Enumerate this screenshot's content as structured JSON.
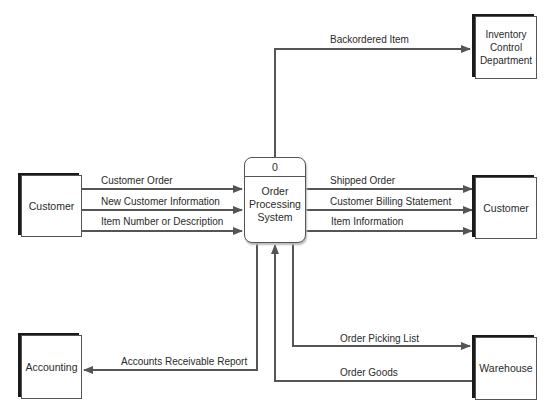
{
  "process": {
    "id": "0",
    "name": "Order\nProcessing\nSystem"
  },
  "entities": {
    "customer_left": "Customer",
    "customer_right": "Customer",
    "inventory": "Inventory\nControl\nDepartment",
    "accounting": "Accounting",
    "warehouse": "Warehouse"
  },
  "flows": {
    "customer_order": "Customer Order",
    "new_customer_info": "New Customer Information",
    "item_number": "Item Number or Description",
    "backordered_item": "Backordered Item",
    "shipped_order": "Shipped Order",
    "billing_statement": "Customer Billing Statement",
    "item_information": "Item Information",
    "accounts_receivable": "Accounts Receivable Report",
    "order_picking_list": "Order Picking List",
    "order_goods": "Order Goods"
  },
  "colors": {
    "line": "#555555",
    "shadow": "#1a1a1a"
  }
}
